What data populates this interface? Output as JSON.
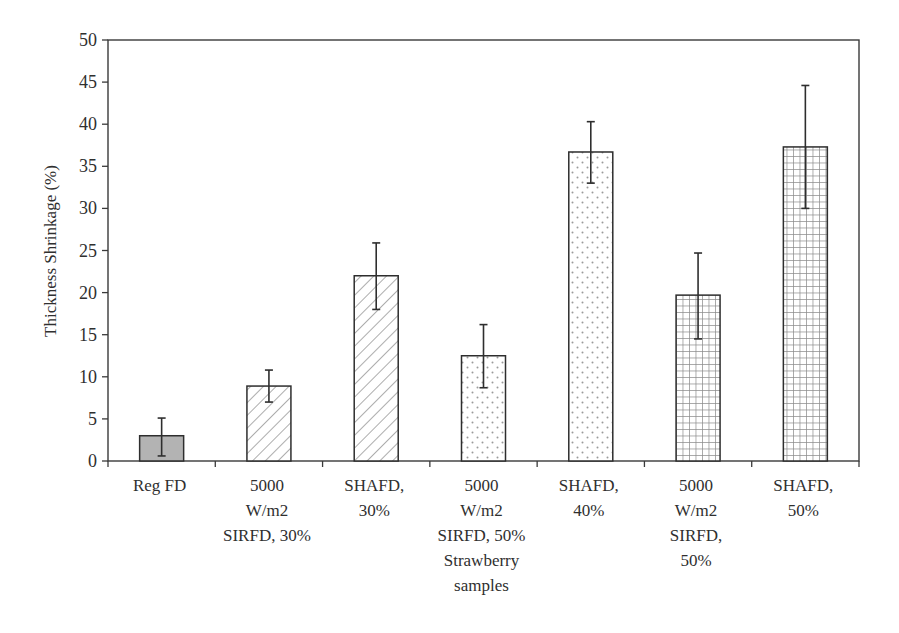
{
  "chart_data": {
    "type": "bar",
    "title": "",
    "xlabel": "Strawberry samples",
    "ylabel": "Thickness Shrinkage (%)",
    "ylim": [
      0,
      50
    ],
    "yticks": [
      0,
      5,
      10,
      15,
      20,
      25,
      30,
      35,
      40,
      45,
      50
    ],
    "grid": false,
    "legend": null,
    "categories": [
      "Reg FD",
      "5000 W/m2 SIRFD, 30%",
      "SHAFD, 30%",
      "5000 W/m2 SIRFD, 50%",
      "SHAFD, 40%",
      "5000 W/m2 SIRFD, 50%",
      "SHAFD, 50%"
    ],
    "category_label_lines": [
      [
        "Reg FD"
      ],
      [
        "5000",
        "W/m2",
        "SIRFD, 30%"
      ],
      [
        "SHAFD,",
        "30%"
      ],
      [
        "5000",
        "W/m2",
        "SIRFD, 50%",
        "Strawberry",
        "samples"
      ],
      [
        "SHAFD,",
        "40%"
      ],
      [
        "5000",
        "W/m2",
        "SIRFD,",
        "50%"
      ],
      [
        "SHAFD,",
        "50%"
      ]
    ],
    "values": [
      3.0,
      8.9,
      22.0,
      12.5,
      36.7,
      19.7,
      37.3
    ],
    "error_low": [
      0.6,
      7.0,
      18.0,
      8.7,
      33.0,
      14.5,
      30.0
    ],
    "error_high": [
      5.1,
      10.8,
      25.9,
      16.2,
      40.3,
      24.7,
      44.6
    ],
    "fill_patterns": [
      "solid-grey",
      "diagonal-hatch",
      "diagonal-hatch",
      "dots",
      "dots",
      "grid",
      "grid"
    ],
    "colors": {
      "solid_fill": "#b3b3b3",
      "pattern_stroke": "#8a8a8a",
      "outline": "#2e2e2e",
      "axis": "#3a3a3a"
    }
  }
}
